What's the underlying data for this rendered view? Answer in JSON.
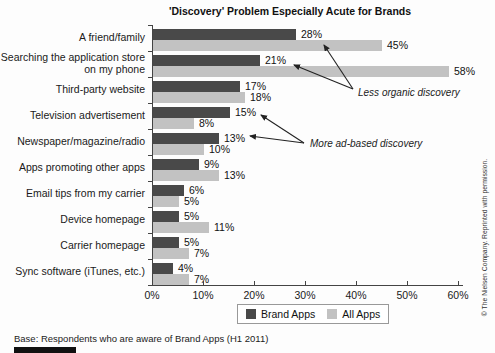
{
  "title": "'Discovery' Problem Especially Acute for Brands",
  "chart_data": {
    "type": "bar",
    "orientation": "horizontal",
    "title": "'Discovery' Problem Especially Acute for Brands",
    "categories": [
      "A friend/family",
      "Searching the application store on my phone",
      "Third-party website",
      "Television advertisement",
      "Newspaper/magazine/radio",
      "Apps promoting other apps",
      "Email tips from my carrier",
      "Device homepage",
      "Carrier homepage",
      "Sync software (iTunes, etc.)"
    ],
    "series": [
      {
        "name": "Brand Apps",
        "color": "#494949",
        "values": [
          28,
          21,
          17,
          15,
          13,
          9,
          6,
          5,
          5,
          4
        ]
      },
      {
        "name": "All Apps",
        "color": "#c2c2c2",
        "values": [
          45,
          58,
          18,
          8,
          10,
          13,
          5,
          11,
          7,
          7
        ]
      }
    ],
    "value_suffix": "%",
    "xlim": [
      0,
      60
    ],
    "x_ticks": [
      "0%",
      "10%",
      "20%",
      "30%",
      "40%",
      "50%",
      "60%"
    ],
    "grid": false,
    "legend_position": "bottom",
    "annotations": [
      {
        "text": "Less organic discovery",
        "points_to": [
          "28%",
          "21%"
        ]
      },
      {
        "text": "More ad-based discovery",
        "points_to": [
          "15%",
          "13%"
        ]
      }
    ]
  },
  "footer": {
    "base_note": "Base: Respondents who are aware of Brand Apps (H1 2011)"
  },
  "copyright_note": "© The Nielsen Company. Reprinted with permission."
}
